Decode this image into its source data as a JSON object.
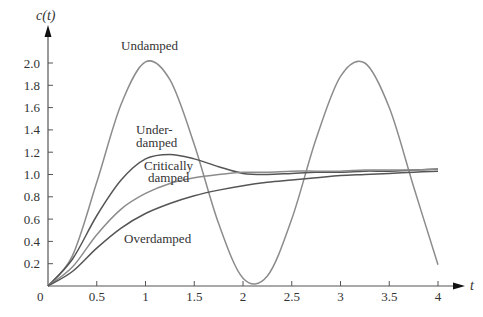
{
  "chart_data": {
    "type": "line",
    "title": "",
    "xlabel": "t",
    "ylabel": "c(t)",
    "xlim": [
      0,
      4
    ],
    "ylim": [
      0,
      2.1
    ],
    "grid": false,
    "legend": "inline labels",
    "x_ticks": [
      "0",
      "0.5",
      "1",
      "1.5",
      "2",
      "2.5",
      "3",
      "3.5",
      "4"
    ],
    "y_ticks": [
      "0.2",
      "0.4",
      "0.6",
      "0.8",
      "1.0",
      "1.2",
      "1.4",
      "1.6",
      "1.8",
      "2.0"
    ],
    "x": [
      0,
      0.25,
      0.5,
      0.75,
      1.0,
      1.25,
      1.5,
      1.75,
      2.0,
      2.25,
      2.5,
      2.75,
      3.0,
      3.25,
      3.5,
      3.75,
      4.0
    ],
    "series": [
      {
        "name": "Undamped",
        "values": [
          0,
          0.27,
          0.93,
          1.63,
          2.01,
          1.85,
          1.27,
          0.56,
          0.07,
          0.09,
          0.6,
          1.32,
          1.88,
          2.0,
          1.6,
          0.89,
          0.19
        ],
        "color": "#8c8c8c"
      },
      {
        "name": "Underdamped",
        "values": [
          0,
          0.24,
          0.63,
          0.95,
          1.14,
          1.18,
          1.14,
          1.07,
          1.01,
          1.0,
          1.01,
          1.02,
          1.02,
          1.03,
          1.03,
          1.04,
          1.05
        ],
        "color": "#555555"
      },
      {
        "name": "Critically damped",
        "values": [
          0,
          0.17,
          0.46,
          0.69,
          0.83,
          0.92,
          0.97,
          1.0,
          1.02,
          1.02,
          1.03,
          1.03,
          1.03,
          1.04,
          1.04,
          1.04,
          1.05
        ],
        "color": "#8c8c8c"
      },
      {
        "name": "Overdamped",
        "values": [
          0,
          0.13,
          0.34,
          0.52,
          0.65,
          0.74,
          0.81,
          0.86,
          0.9,
          0.93,
          0.95,
          0.97,
          0.99,
          1.0,
          1.01,
          1.02,
          1.03
        ],
        "color": "#555555"
      }
    ],
    "annotations": [
      {
        "text": "Undamped",
        "x": 1.05,
        "y": 2.1
      },
      {
        "text": "Under-",
        "x": 1.12,
        "y": 1.37
      },
      {
        "text": "damped",
        "x": 1.12,
        "y": 1.27
      },
      {
        "text": "Critically",
        "x": 1.25,
        "y": 1.12
      },
      {
        "text": "damped",
        "x": 1.25,
        "y": 1.02
      },
      {
        "text": "Overdamped",
        "x": 1.15,
        "y": 0.44
      }
    ]
  },
  "labels": {
    "ylabel": "c(t)",
    "xlabel": "t",
    "origin": "0",
    "undamped": "Undamped",
    "under1": "Under-",
    "under2": "damped",
    "crit1": "Critically",
    "crit2": "damped",
    "over": "Overdamped"
  }
}
